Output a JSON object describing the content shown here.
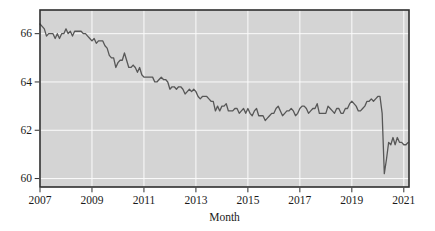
{
  "figure": {
    "title": "",
    "xlabel": "Month",
    "ylabel": ""
  },
  "chart_data": {
    "type": "line",
    "title": "",
    "xlabel": "Month",
    "ylabel": "",
    "x_start": "2007-01",
    "x_interval": "month",
    "xlim": [
      2007,
      2021.2
    ],
    "ylim": [
      59.65,
      66.98
    ],
    "xticks": [
      2007,
      2009,
      2011,
      2013,
      2015,
      2017,
      2019,
      2021
    ],
    "yticks": [
      60,
      62,
      64,
      66
    ],
    "grid": true,
    "legend": false,
    "plot_bg": "#d4d4d4",
    "grid_color": "#fbfbfb",
    "line_color": "#575757",
    "frame_color": "#2e2e2e",
    "label_color": "#1a1a1a",
    "series": [
      {
        "name": "series-1",
        "values": [
          66.4,
          66.3,
          66.2,
          65.9,
          66.0,
          66.0,
          66.0,
          65.8,
          66.0,
          65.8,
          66.0,
          66.0,
          66.2,
          66.0,
          66.1,
          65.9,
          66.1,
          66.1,
          66.1,
          66.1,
          66.0,
          66.0,
          65.9,
          65.8,
          65.7,
          65.8,
          65.6,
          65.7,
          65.7,
          65.7,
          65.5,
          65.4,
          65.1,
          65.0,
          65.0,
          64.6,
          64.8,
          64.9,
          64.9,
          65.2,
          64.9,
          64.6,
          64.6,
          64.7,
          64.6,
          64.4,
          64.6,
          64.3,
          64.2,
          64.2,
          64.2,
          64.2,
          64.2,
          64.0,
          64.0,
          64.1,
          64.2,
          64.1,
          64.1,
          64.0,
          63.7,
          63.8,
          63.8,
          63.7,
          63.8,
          63.8,
          63.7,
          63.5,
          63.6,
          63.7,
          63.6,
          63.7,
          63.6,
          63.4,
          63.3,
          63.4,
          63.4,
          63.4,
          63.3,
          63.2,
          63.2,
          62.8,
          63.0,
          62.8,
          63.0,
          63.0,
          63.1,
          62.8,
          62.8,
          62.8,
          62.9,
          62.9,
          62.7,
          62.8,
          62.9,
          62.7,
          62.9,
          62.7,
          62.6,
          62.8,
          62.9,
          62.6,
          62.6,
          62.6,
          62.4,
          62.5,
          62.6,
          62.7,
          62.7,
          62.9,
          63.0,
          62.8,
          62.6,
          62.7,
          62.8,
          62.8,
          62.9,
          62.8,
          62.6,
          62.7,
          62.9,
          63.0,
          63.0,
          62.9,
          62.7,
          62.8,
          62.9,
          62.9,
          63.1,
          62.7,
          62.7,
          62.7,
          62.7,
          63.0,
          62.9,
          62.8,
          62.7,
          62.9,
          62.9,
          62.7,
          62.7,
          62.9,
          62.9,
          63.1,
          63.2,
          63.1,
          63.0,
          62.8,
          62.8,
          62.9,
          63.0,
          63.2,
          63.2,
          63.3,
          63.2,
          63.3,
          63.4,
          63.4,
          62.7,
          60.2,
          60.8,
          61.5,
          61.4,
          61.7,
          61.4,
          61.7,
          61.5,
          61.5,
          61.4,
          61.4,
          61.5
        ]
      }
    ]
  }
}
